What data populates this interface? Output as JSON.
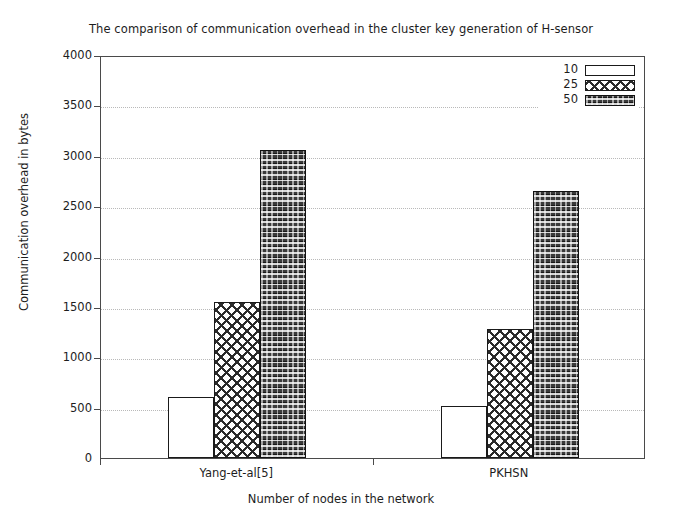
{
  "chart_data": {
    "type": "bar",
    "title": "The comparison of communication overhead in the cluster key generation of H-sensor",
    "xlabel": "Number of nodes in the network",
    "ylabel": "Communication overhead in bytes",
    "categories": [
      "Yang-et-al[5]",
      "PKHSN"
    ],
    "series": [
      {
        "name": "10",
        "values": [
          605,
          520
        ]
      },
      {
        "name": "25",
        "values": [
          1545,
          1280
        ]
      },
      {
        "name": "50",
        "values": [
          3060,
          2655
        ]
      }
    ],
    "ylim": [
      0,
      4000
    ],
    "ytick_labels": [
      "0",
      "500",
      "1000",
      "1500",
      "2000",
      "2500",
      "3000",
      "3500",
      "4000"
    ],
    "ytick_values": [
      0,
      500,
      1000,
      1500,
      2000,
      2500,
      3000,
      3500,
      4000
    ],
    "grid": true,
    "legend_position": "top-right",
    "legend_entries": [
      "10",
      "25",
      "50"
    ],
    "colors": {
      "series_10": "#ffffff",
      "series_25": "#2b2b2b",
      "series_50": "#3a3a3a",
      "axis": "#4a4a4a",
      "grid": "#b9b9b9",
      "text": "#1d1d1d",
      "background": "#ffffff"
    }
  }
}
